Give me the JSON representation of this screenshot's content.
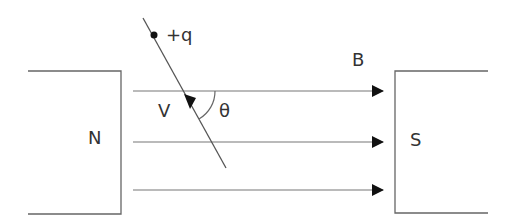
{
  "diagram": {
    "type": "physics-magnetic-field",
    "labels": {
      "north_pole": "N",
      "south_pole": "S",
      "field": "B",
      "velocity": "V",
      "angle": "θ",
      "charge": "+q"
    },
    "field_lines_count": 3,
    "colors": {
      "line": "#555555",
      "text": "#333333",
      "arrowhead": "#111111"
    }
  }
}
